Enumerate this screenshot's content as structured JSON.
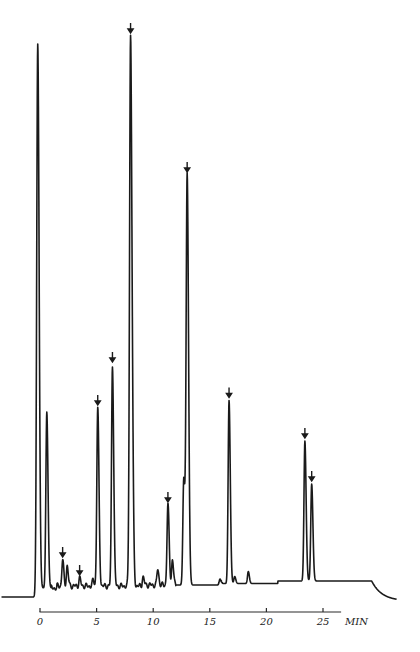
{
  "chart_data": {
    "type": "line",
    "title": "",
    "xlabel": "MIN",
    "ylabel": "",
    "xlim": [
      -0.5,
      32
    ],
    "ylim": [
      0,
      560
    ],
    "grid": false,
    "x_ticks": [
      0,
      5,
      10,
      15,
      20,
      25
    ],
    "x_tick_labels": [
      "0",
      "5",
      "10",
      "15",
      "20",
      "25"
    ],
    "axis_unit_label": "MIN",
    "baseline": {
      "pre_injection": -11,
      "main": 0,
      "end_step_time": 29.3,
      "end_level": -15
    },
    "peaks": [
      {
        "time": -0.2,
        "height": 544,
        "marked": false,
        "label": "solvent"
      },
      {
        "time": 0.6,
        "height": 176,
        "marked": false
      },
      {
        "time": 2.0,
        "height": 26,
        "marked": true
      },
      {
        "time": 2.4,
        "height": 20,
        "marked": false
      },
      {
        "time": 3.5,
        "height": 8,
        "marked": true
      },
      {
        "time": 4.7,
        "height": 6,
        "marked": false
      },
      {
        "time": 5.1,
        "height": 178,
        "marked": true
      },
      {
        "time": 6.4,
        "height": 221,
        "marked": true
      },
      {
        "time": 8.0,
        "height": 550,
        "marked": true
      },
      {
        "time": 8.2,
        "height": 46,
        "marked": false
      },
      {
        "time": 9.1,
        "height": 8,
        "marked": false
      },
      {
        "time": 10.4,
        "height": 16,
        "marked": false
      },
      {
        "time": 11.3,
        "height": 80,
        "marked": true
      },
      {
        "time": 11.7,
        "height": 25,
        "marked": false
      },
      {
        "time": 12.7,
        "height": 106,
        "marked": false
      },
      {
        "time": 13.0,
        "height": 410,
        "marked": true
      },
      {
        "time": 15.9,
        "height": 6,
        "marked": false
      },
      {
        "time": 16.7,
        "height": 183,
        "marked": true
      },
      {
        "time": 17.2,
        "height": 7,
        "marked": false
      },
      {
        "time": 18.4,
        "height": 12,
        "marked": false
      },
      {
        "time": 23.4,
        "height": 140,
        "marked": true
      },
      {
        "time": 24.0,
        "height": 97,
        "marked": true
      }
    ]
  }
}
